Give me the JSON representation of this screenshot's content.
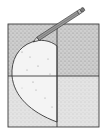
{
  "illustration": {
    "description": "Square divided into four stippled quadrants with a pencil drawing a half-heart outline",
    "colors": {
      "background": "#ffffff",
      "stipple_dark": "#bdbdbd",
      "stipple_light": "#d9d9d9",
      "heart_fill": "#f2f2f2",
      "line": "#3a3a3a"
    },
    "icons": [
      "pencil-icon",
      "half-heart-shape"
    ]
  }
}
